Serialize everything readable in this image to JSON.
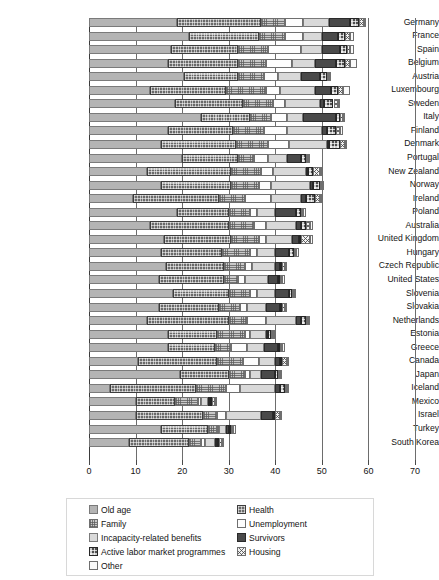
{
  "chart_data": {
    "type": "bar",
    "orientation": "horizontal",
    "stacked": true,
    "title": "",
    "xlabel": "",
    "ylabel": "",
    "xlim": [
      0,
      70
    ],
    "xticks": [
      0,
      10,
      20,
      30,
      40,
      50,
      60,
      70
    ],
    "grid": true,
    "legend_position": "bottom",
    "categories": [
      "Germany",
      "France",
      "Spain",
      "Belgium",
      "Austria",
      "Luxembourg",
      "Sweden",
      "Italy",
      "Finland",
      "Denmark",
      "Portugal",
      "New Zealand",
      "Norway",
      "Ireland",
      "Poland",
      "Australia",
      "United Kingdom",
      "Hungary",
      "Czech Republic",
      "United States",
      "Slovenia",
      "Slovakia",
      "Netherlands",
      "Estonia",
      "Greece",
      "Canada",
      "Japan",
      "Iceland",
      "Mexico",
      "Israel",
      "Turkey",
      "South Korea"
    ],
    "series": [
      {
        "name": "Old age",
        "values": [
          19.0,
          21.5,
          17.5,
          17.0,
          20.5,
          13.0,
          18.5,
          24.0,
          17.0,
          15.5,
          20.0,
          12.5,
          15.5,
          9.5,
          19.0,
          13.0,
          16.0,
          15.5,
          16.5,
          15.0,
          18.0,
          15.0,
          12.5,
          17.0,
          17.0,
          10.5,
          19.5,
          4.5,
          10.0,
          10.0,
          15.5,
          8.5
        ]
      },
      {
        "name": "Health",
        "values": [
          18.0,
          15.0,
          14.5,
          15.0,
          11.5,
          16.5,
          14.5,
          10.5,
          14.0,
          16.0,
          12.0,
          18.0,
          15.0,
          18.5,
          11.0,
          17.0,
          14.5,
          13.0,
          12.5,
          14.0,
          12.0,
          13.0,
          17.5,
          10.5,
          10.0,
          17.0,
          10.5,
          18.5,
          8.5,
          14.5,
          10.0,
          13.0
        ]
      },
      {
        "name": "Family",
        "values": [
          5.0,
          5.5,
          6.5,
          6.0,
          5.5,
          8.5,
          6.5,
          4.5,
          6.5,
          7.0,
          3.5,
          6.5,
          6.0,
          5.5,
          4.5,
          5.5,
          6.0,
          6.0,
          4.5,
          3.0,
          4.5,
          4.5,
          4.0,
          6.0,
          3.5,
          5.5,
          3.5,
          6.5,
          5.0,
          3.0,
          2.0,
          2.5
        ]
      },
      {
        "name": "Unemployment",
        "values": [
          4.0,
          4.0,
          7.0,
          5.5,
          3.0,
          3.0,
          2.5,
          3.5,
          5.0,
          4.5,
          3.0,
          2.5,
          2.5,
          5.5,
          1.5,
          2.5,
          1.5,
          1.5,
          1.5,
          1.5,
          1.5,
          1.5,
          4.0,
          1.0,
          3.5,
          3.5,
          1.0,
          3.0,
          0.5,
          2.0,
          0.5,
          1.0
        ]
      },
      {
        "name": "Incapacity-related benefits",
        "values": [
          5.5,
          4.0,
          4.5,
          5.0,
          5.0,
          7.5,
          7.5,
          3.5,
          7.5,
          8.0,
          4.0,
          7.0,
          8.5,
          6.5,
          4.0,
          6.5,
          5.5,
          4.0,
          5.0,
          5.0,
          4.0,
          4.0,
          6.5,
          3.5,
          3.5,
          3.5,
          2.5,
          7.5,
          1.5,
          7.5,
          1.5,
          2.0
        ]
      },
      {
        "name": "Survivors",
        "values": [
          4.5,
          3.5,
          4.0,
          4.5,
          4.0,
          3.5,
          1.0,
          7.0,
          1.0,
          0.5,
          3.0,
          0.5,
          0.5,
          1.0,
          4.5,
          1.0,
          1.5,
          3.0,
          1.0,
          2.0,
          3.0,
          3.0,
          1.0,
          0.5,
          3.0,
          1.0,
          3.0,
          1.0,
          0.5,
          2.5,
          0.5,
          0.5
        ]
      },
      {
        "name": "Active labor market programmes",
        "values": [
          2.0,
          1.5,
          1.5,
          2.0,
          1.5,
          1.5,
          2.0,
          1.0,
          2.0,
          2.5,
          1.0,
          1.0,
          1.5,
          2.0,
          1.0,
          1.0,
          0.5,
          1.0,
          0.5,
          0.5,
          0.5,
          0.5,
          1.0,
          0.5,
          0.5,
          0.5,
          0.5,
          1.0,
          0.5,
          0.5,
          0.5,
          0.5
        ]
      },
      {
        "name": "Housing",
        "values": [
          1.0,
          1.0,
          0.5,
          1.0,
          0.5,
          1.0,
          1.0,
          0.5,
          1.0,
          1.0,
          0.5,
          1.5,
          0.5,
          1.0,
          0.5,
          1.0,
          2.0,
          0.5,
          0.5,
          0.5,
          0.5,
          0.5,
          0.5,
          0.5,
          0.5,
          1.0,
          0.5,
          0.5,
          0.5,
          1.0,
          0.5,
          0.5
        ]
      },
      {
        "name": "Other",
        "values": [
          0.5,
          1.0,
          1.0,
          1.5,
          0.5,
          1.5,
          0.5,
          0.5,
          0.5,
          0.5,
          0.5,
          0.5,
          0.5,
          0.5,
          0.5,
          0.5,
          0.5,
          0.5,
          0.5,
          0.5,
          0.5,
          0.5,
          0.5,
          0.5,
          0.5,
          0.5,
          0.5,
          0.5,
          0.5,
          0.5,
          0.5,
          0.5
        ]
      }
    ],
    "series_patterns": [
      "p-oldage",
      "p-health",
      "p-family",
      "p-unemp",
      "p-incap",
      "p-surv",
      "p-almp",
      "p-house",
      "p-other"
    ],
    "legend_entries": [
      {
        "label": "Old age",
        "pattern": "p-oldage",
        "col": 0,
        "row": 0
      },
      {
        "label": "Family",
        "pattern": "p-family",
        "col": 0,
        "row": 1
      },
      {
        "label": "Incapacity-related benefits",
        "pattern": "p-incap",
        "col": 0,
        "row": 2
      },
      {
        "label": "Active labor market programmes",
        "pattern": "p-almp",
        "col": 0,
        "row": 3
      },
      {
        "label": "Other",
        "pattern": "p-other",
        "col": 0,
        "row": 4
      },
      {
        "label": "Health",
        "pattern": "p-health",
        "col": 1,
        "row": 0
      },
      {
        "label": "Unemployment",
        "pattern": "p-unemp",
        "col": 1,
        "row": 1
      },
      {
        "label": "Survivors",
        "pattern": "p-surv",
        "col": 1,
        "row": 2
      },
      {
        "label": "Housing",
        "pattern": "p-house",
        "col": 1,
        "row": 3
      }
    ]
  }
}
